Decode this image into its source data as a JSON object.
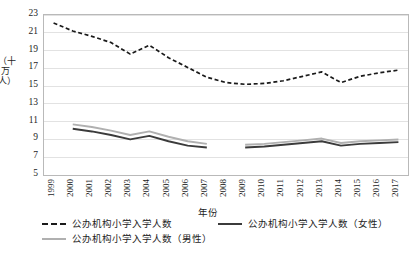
{
  "chart_data": {
    "type": "line",
    "title": "",
    "xlabel": "年份",
    "ylabel": "（十万人）",
    "grid": true,
    "legend_position": "bottom",
    "ylim": [
      5,
      23
    ],
    "yticks": [
      5,
      7,
      9,
      11,
      13,
      15,
      17,
      19,
      21,
      23
    ],
    "categories": [
      "1999",
      "2000",
      "2001",
      "2002",
      "2003",
      "2004",
      "2005",
      "2006",
      "2007",
      "2008",
      "2009",
      "2010",
      "2011",
      "2012",
      "2013",
      "2014",
      "2015",
      "2016",
      "2017"
    ],
    "series": [
      {
        "name": "公办机构小学入学人数",
        "style": "dashed",
        "color": "#1a1a1a",
        "values": [
          22.1,
          21.2,
          20.6,
          19.9,
          18.6,
          19.6,
          18.2,
          17.1,
          16.0,
          15.4,
          15.2,
          15.3,
          15.6,
          16.1,
          16.6,
          15.4,
          16.1,
          16.5,
          16.8
        ]
      },
      {
        "name": "公办机构小学入学人数（女性）",
        "style": "solid",
        "color": "#3b3b3b",
        "values": [
          null,
          10.2,
          9.9,
          9.5,
          9.0,
          9.4,
          8.8,
          8.3,
          8.1,
          null,
          8.1,
          8.2,
          8.4,
          8.6,
          8.8,
          8.3,
          8.5,
          8.6,
          8.7
        ]
      },
      {
        "name": "公办机构小学入学人数（男性）",
        "style": "solid",
        "color": "#b0b0b0",
        "values": [
          null,
          10.7,
          10.4,
          10.0,
          9.5,
          9.9,
          9.3,
          8.8,
          8.5,
          null,
          8.4,
          8.5,
          8.7,
          8.9,
          9.1,
          8.6,
          8.8,
          8.9,
          9.0
        ]
      }
    ]
  },
  "legend": {
    "items": [
      {
        "label": "公办机构小学入学人数",
        "swatch": "dashed-line-swatch"
      },
      {
        "label": "公办机构小学入学人数（女性）",
        "swatch": "female-line-swatch"
      },
      {
        "label": "公办机构小学入学人数（男性）",
        "swatch": "male-line-swatch"
      }
    ]
  }
}
